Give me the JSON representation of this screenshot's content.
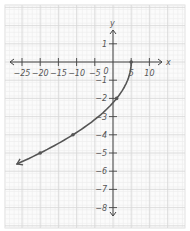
{
  "chart_data": {
    "type": "line",
    "title": "",
    "xlabel": "x",
    "ylabel": "y",
    "xlim": [
      -27,
      12
    ],
    "ylim": [
      -8.6,
      2.2
    ],
    "grid": true,
    "x_ticks": [
      -25,
      -20,
      -15,
      -10,
      -5,
      0,
      5,
      10
    ],
    "x_tick_labels": [
      "−25",
      "−20",
      "−15",
      "−10",
      "−5",
      "0",
      "5",
      "10"
    ],
    "y_ticks": [
      1,
      -1,
      -2,
      -3,
      -4,
      -5,
      -6,
      -7,
      -8
    ],
    "y_tick_labels": [
      "1",
      "−1",
      "−2",
      "−3",
      "−4",
      "−5",
      "−6",
      "−7",
      "−8"
    ],
    "series": [
      {
        "name": "x = 5 − y², y ≤ 0",
        "points": [
          [
            5,
            0
          ],
          [
            1,
            -2
          ],
          [
            -11,
            -4
          ],
          [
            -20,
            -5
          ]
        ],
        "curve": "x = 5 - y^2",
        "domain_y": [
          -5.6,
          0
        ],
        "endpoint_arrow": "toward (-27, -5.6)",
        "marked_points": [
          [
            5,
            0
          ],
          [
            1,
            -2
          ],
          [
            -11,
            -4
          ],
          [
            -20,
            -5
          ]
        ]
      }
    ],
    "colors": {
      "curve": "#555555",
      "axis": "#444444",
      "grid_major": "#d6d6d6",
      "grid_minor": "#ececec"
    }
  }
}
